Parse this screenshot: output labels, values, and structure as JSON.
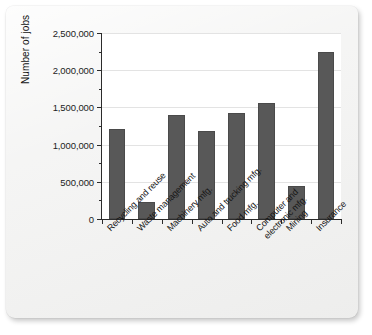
{
  "chart_data": {
    "type": "bar",
    "title": "",
    "xlabel": "",
    "ylabel": "Number of jobs",
    "categories": [
      "Recycling and reuse",
      "Waste management",
      "Machinery mfg.",
      "Auto and trucking mfg.",
      "Food mfg.",
      "Computer and\nelectronic mfg.",
      "Mining",
      "Insurance"
    ],
    "category_lines": [
      [
        "Recycling and reuse"
      ],
      [
        "Waste management"
      ],
      [
        "Machinery mfg."
      ],
      [
        "Auto and trucking mfg."
      ],
      [
        "Food mfg."
      ],
      [
        "Computer and",
        "electronic mfg."
      ],
      [
        "Mining"
      ],
      [
        "Insurance"
      ]
    ],
    "values": [
      1210000,
      230000,
      1400000,
      1180000,
      1420000,
      1560000,
      450000,
      2250000
    ],
    "ylim": [
      0,
      2500000
    ],
    "ytick_values": [
      0,
      500000,
      1000000,
      1500000,
      2000000,
      2500000
    ],
    "ytick_labels": [
      "0",
      "500,000",
      "1,000,000",
      "1,500,000",
      "2,000,000",
      "2,500,000"
    ],
    "grid": true,
    "grid_axis": "y",
    "legend": false,
    "bar_color": "#585858",
    "axis_color": "#2b2b2b",
    "plot_background": "#ffffff",
    "page_background": "#f2f2f1"
  }
}
